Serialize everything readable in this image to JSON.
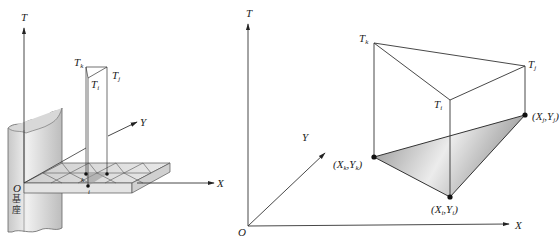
{
  "left_diagram": {
    "axes": {
      "t_label": "T",
      "x_label": "X",
      "y_label": "Y",
      "origin_label": "O"
    },
    "prism_top_labels": {
      "tk": {
        "base": "T",
        "sub": "k"
      },
      "tj": {
        "base": "T",
        "sub": "j"
      },
      "ti": {
        "base": "T",
        "sub": "i"
      }
    },
    "grid_node_labels": {
      "k": "k",
      "i": "i"
    },
    "base_label": "基座"
  },
  "right_diagram": {
    "axes": {
      "t_label": "T",
      "x_label": "X",
      "y_label": "Y",
      "origin_label": "O"
    },
    "top_vertices": {
      "tk": {
        "base": "T",
        "sub": "k"
      },
      "tj": {
        "base": "T",
        "sub": "j"
      },
      "ti": {
        "base": "T",
        "sub": "i"
      }
    },
    "base_vertices": {
      "k": {
        "text": "(X",
        "sub1": "k",
        "mid": ",Y",
        "sub2": "k",
        "end": ")"
      },
      "i": {
        "text": "(X",
        "sub1": "i",
        "mid": ",Y",
        "sub2": "i",
        "end": ")"
      },
      "j": {
        "text": "(X",
        "sub1": "j",
        "mid": ",Y",
        "sub2": "j",
        "end": ")"
      }
    },
    "colors": {
      "triangle_fill_dark": "#9a9a9a",
      "triangle_fill_light": "#e6e6e6",
      "line": "#333333"
    }
  }
}
